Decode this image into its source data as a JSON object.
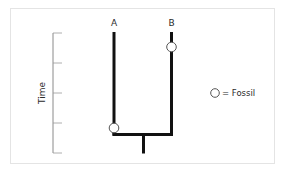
{
  "diagram": {
    "type": "phylogenetic-tree",
    "taxa": [
      {
        "label": "A",
        "x": 114,
        "top_y": 32
      },
      {
        "label": "B",
        "x": 171,
        "top_y": 32
      }
    ],
    "fossils": [
      {
        "taxon": "A",
        "x": 114,
        "y": 128
      },
      {
        "taxon": "B",
        "x": 171,
        "y": 47
      }
    ],
    "node": {
      "y": 134,
      "stem_x": 143,
      "stem_bottom_y": 153
    },
    "time_axis": {
      "label": "Time",
      "x": 53,
      "top_y": 33,
      "bottom_y": 153,
      "ticks": [
        33,
        63,
        93,
        123,
        153
      ]
    },
    "legend": {
      "symbol": "open-circle",
      "text": "= Fossil"
    },
    "colors": {
      "branch": "#111111",
      "axis": "#8a8a8a",
      "fossil_fill": "#ffffff",
      "fossil_stroke": "#555555",
      "frame": "#e4e4e4"
    }
  }
}
